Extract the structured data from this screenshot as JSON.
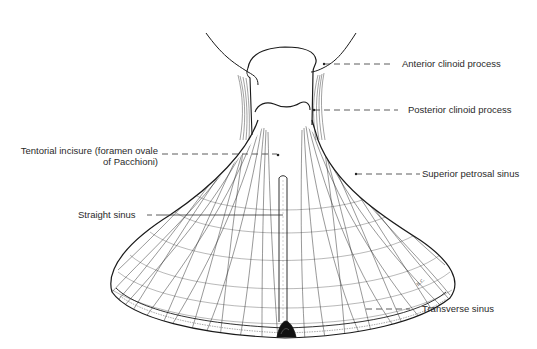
{
  "figure": {
    "signature": "n.c.",
    "stroke_color": "#1a1a1a",
    "background_color": "#ffffff"
  },
  "labels": {
    "anterior_clinoid": "Anterior clinoid process",
    "posterior_clinoid": "Posterior clinoid process",
    "tentorial_incisure_line1": "Tentorial incisure (foramen ovale",
    "tentorial_incisure_line2": "of Pacchioni)",
    "superior_petrosal": "Superior petrosal sinus",
    "straight_sinus": "Straight sinus",
    "transverse_sinus": "Transverse sinus"
  }
}
